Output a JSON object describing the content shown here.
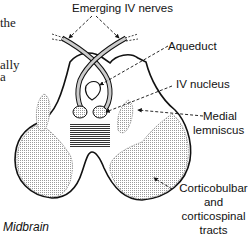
{
  "figure": {
    "title": "Midbrain",
    "cropped_text_left": [
      "the",
      "ally",
      "a"
    ],
    "labels": {
      "emerging_nerves": "Emerging IV nerves",
      "aqueduct": "Aqueduct",
      "nucleus": "IV nucleus",
      "medial_lemniscus": [
        "Medial",
        "lemniscus"
      ],
      "corticobulbar": [
        "Corticobulbar",
        "and",
        "corticospinal",
        "tracts"
      ]
    },
    "colors": {
      "line": "#111111",
      "stipple": "#bdbdbd",
      "background": "#ffffff"
    }
  }
}
